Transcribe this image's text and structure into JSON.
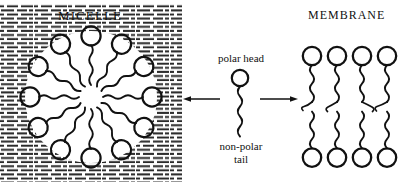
{
  "figure": {
    "width": 405,
    "height": 186,
    "background": "#ffffff",
    "ink_color": "#111111"
  },
  "micelle_panel": {
    "title": "MICELLE",
    "background_texture": "horizontal-dash-hatching",
    "texture_meaning": "water-solvent",
    "amphiphile_count": 12,
    "arrangement": "radial",
    "head_orientation": "outward",
    "tail_orientation": "inward-converging",
    "head_shape": "open-circle",
    "tail_shape": "wavy-zigzag"
  },
  "center_panel": {
    "polar_head_label": "polar head",
    "non_polar_label_line1": "non-polar",
    "non_polar_label_line2": "tail",
    "molecule": {
      "head_shape": "open-circle",
      "tail_shape": "wavy-zigzag"
    },
    "left_arrow_direction": "left",
    "right_arrow_direction": "right"
  },
  "membrane_panel": {
    "title": "MEMBRANE",
    "lipid_column_count": 4,
    "structure": "bilayer",
    "head_shape": "open-circle",
    "tail_shape": "wavy-zigzag",
    "heads_per_column": 2,
    "head_positions": [
      "top",
      "bottom"
    ]
  }
}
